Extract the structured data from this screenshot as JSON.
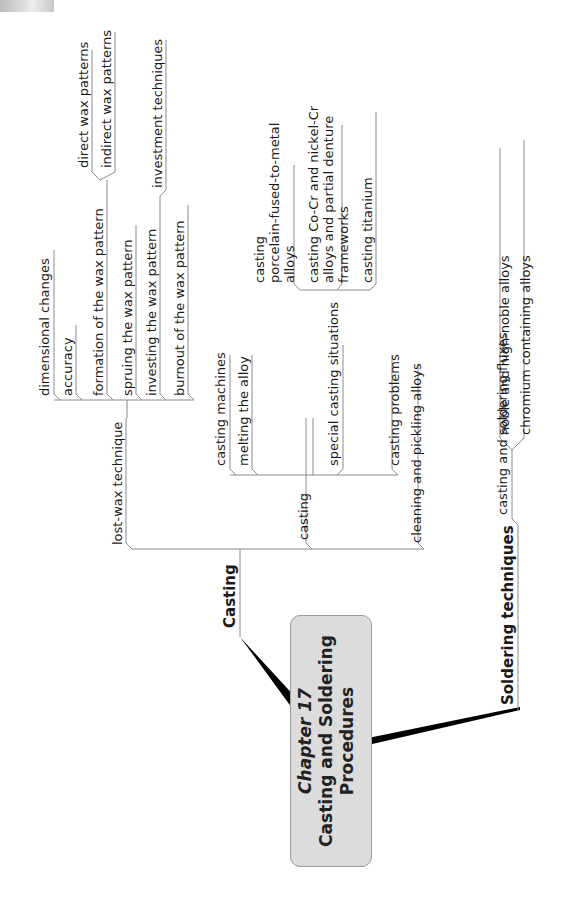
{
  "center": {
    "line1": "Chapter 17",
    "line2": "Casting and Soldering",
    "line3": "Procedures",
    "fill": "#dcdcdc"
  },
  "branches": {
    "casting": {
      "label": "Casting",
      "lost_wax": {
        "label": "lost-wax technique",
        "children": [
          "dimensional changes",
          "accuracy",
          "formation of the wax pattern",
          "spruing the wax pattern",
          "investing the wax pattern",
          "burnout of the wax pattern"
        ],
        "formation_children": [
          "direct wax patterns",
          "indirect wax patterns"
        ],
        "investing_children": [
          "investment techniques"
        ]
      },
      "casting_sub": {
        "label": "casting",
        "children": [
          "casting machines",
          "melting the alloy",
          "special casting situations",
          "casting problems",
          "cleaning and pickling alloys"
        ],
        "special_children": [
          "casting\nporcelain-fused-to-metal\nalloys",
          "casting Co-Cr and nickel-Cr\nalloys and partial denture\nframeworks",
          "casting titanium"
        ]
      }
    },
    "soldering": {
      "label": "Soldering techniques",
      "fluxes": {
        "label": "casting and soldering fluxes",
        "children": [
          "noble and high-noble alloys",
          "chromium containing alloys"
        ]
      }
    }
  },
  "colors": {
    "line": "#8c8c8c",
    "connector": "#000000",
    "text": "#1a1a1a"
  }
}
